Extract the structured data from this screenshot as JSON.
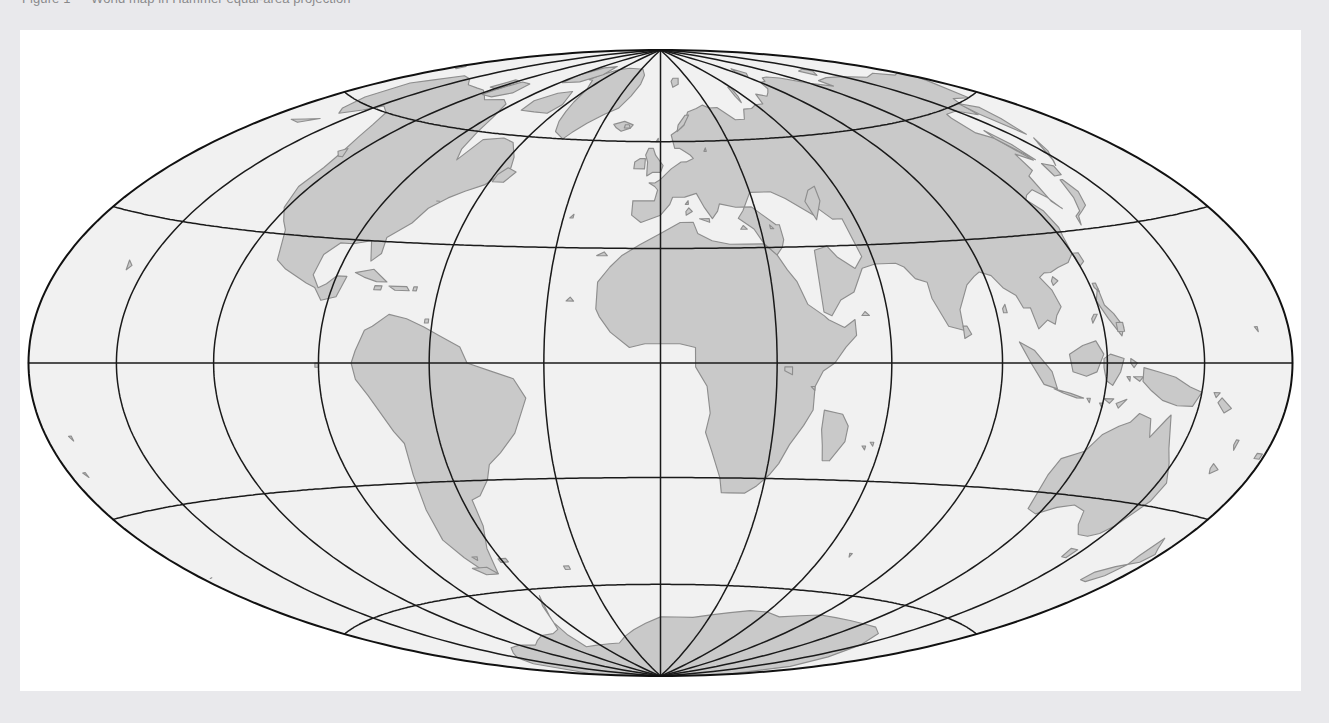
{
  "page": {
    "background_color": "#e9e9ec",
    "document_background": "#ffffff",
    "clipped_header_text": "Figure 1 — World map in Hammer equal-area projection"
  },
  "map": {
    "title": "World Map",
    "projection": "Hammer (equal-area, elliptical)",
    "central_meridian_degrees": 0,
    "colors": {
      "ocean": "#f1f1f1",
      "land": "#c9c9c9",
      "coastline": "#8e8e8e",
      "graticule": "#1a1a1a",
      "frame": "#111111"
    },
    "graticule": {
      "meridian_step_degrees": 30,
      "parallel_step_degrees": 30,
      "meridians": [
        -180,
        -150,
        -120,
        -90,
        -60,
        -30,
        0,
        30,
        60,
        90,
        120,
        150,
        180
      ],
      "parallels": [
        -60,
        -30,
        0,
        30,
        60
      ],
      "equator_latitude": 0,
      "prime_meridian_longitude": 0,
      "show_border": true,
      "latitude_range": [
        -90,
        90
      ],
      "longitude_range": [
        -180,
        180
      ]
    },
    "features": [
      "North America",
      "South America",
      "Greenland",
      "Europe",
      "Africa",
      "Asia",
      "Australia",
      "Antarctica",
      "Madagascar",
      "New Guinea",
      "New Zealand",
      "Japan",
      "British Isles",
      "Indonesia",
      "Caribbean",
      "Arctic Archipelago"
    ]
  },
  "chart_data": {
    "type": "map",
    "title": "World Map",
    "projection": "Hammer",
    "xlabel": "Longitude",
    "ylabel": "Latitude",
    "xlim": [
      -180,
      180
    ],
    "ylim": [
      -90,
      90
    ],
    "grid": true,
    "legend": "none"
  }
}
